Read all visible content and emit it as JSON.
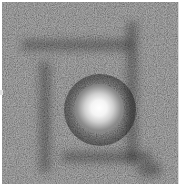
{
  "image": {
    "description": "Grayscale noisy image with a bright blurred point source near center",
    "background_color": "#2e2e2e",
    "highlight_color": "#ffffff",
    "blob_center": [
      97,
      107
    ],
    "blob_radius": 22,
    "left_tick_y": 92
  }
}
